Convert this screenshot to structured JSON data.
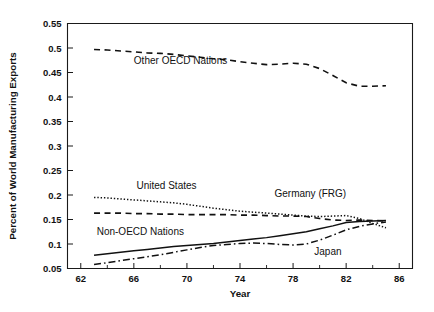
{
  "chart_data": {
    "type": "line",
    "title": "",
    "xlabel": "Year",
    "ylabel": "Percent of World Manufacturing Exports",
    "xlim": [
      61,
      87
    ],
    "ylim": [
      0.05,
      0.55
    ],
    "grid": false,
    "legend_position": "inline-annotations",
    "xticks": [
      62,
      66,
      70,
      74,
      78,
      82,
      86
    ],
    "xticks_minor": [
      64,
      68,
      72,
      76,
      80,
      84
    ],
    "yticks": [
      0.05,
      0.1,
      0.15,
      0.2,
      0.25,
      0.3,
      0.35,
      0.4,
      0.45,
      0.5,
      0.55
    ],
    "ytick_labels": [
      "0.05",
      "0.1",
      "0.15",
      "0.2",
      "0.25",
      "0.3",
      "0.35",
      "0.4",
      "0.45",
      "0.5",
      "0.55"
    ],
    "xtick_labels": [
      "62",
      "66",
      "70",
      "74",
      "78",
      "82",
      "86"
    ],
    "x": [
      63,
      64,
      65,
      66,
      67,
      68,
      69,
      70,
      71,
      72,
      73,
      74,
      75,
      76,
      77,
      78,
      79,
      80,
      81,
      82,
      83,
      84,
      85
    ],
    "series": [
      {
        "name": "Other OECD Nations",
        "linestyle": "dashed",
        "color": "#111111",
        "label_x": 66.0,
        "label_y": 0.468,
        "values": [
          0.497,
          0.496,
          0.494,
          0.492,
          0.49,
          0.489,
          0.487,
          0.484,
          0.481,
          0.478,
          0.476,
          0.472,
          0.469,
          0.466,
          0.467,
          0.469,
          0.467,
          0.458,
          0.444,
          0.429,
          0.422,
          0.422,
          0.423
        ]
      },
      {
        "name": "United States",
        "linestyle": "dotted",
        "color": "#111111",
        "label_x": 66.2,
        "label_y": 0.213,
        "values": [
          0.195,
          0.194,
          0.192,
          0.19,
          0.188,
          0.186,
          0.184,
          0.181,
          0.177,
          0.173,
          0.17,
          0.167,
          0.165,
          0.163,
          0.161,
          0.159,
          0.157,
          0.156,
          0.157,
          0.158,
          0.152,
          0.142,
          0.133
        ]
      },
      {
        "name": "Germany (FRG)",
        "linestyle": "dashed",
        "color": "#111111",
        "label_x": 76.6,
        "label_y": 0.196,
        "values": [
          0.163,
          0.163,
          0.163,
          0.162,
          0.162,
          0.161,
          0.161,
          0.16,
          0.16,
          0.16,
          0.16,
          0.159,
          0.159,
          0.158,
          0.157,
          0.157,
          0.156,
          0.152,
          0.149,
          0.148,
          0.149,
          0.148,
          0.147
        ]
      },
      {
        "name": "Non-OECD Nations",
        "linestyle": "solid",
        "color": "#111111",
        "label_x": 63.2,
        "label_y": 0.118,
        "values": [
          0.077,
          0.08,
          0.083,
          0.086,
          0.089,
          0.092,
          0.095,
          0.097,
          0.099,
          0.101,
          0.104,
          0.107,
          0.11,
          0.113,
          0.117,
          0.121,
          0.125,
          0.131,
          0.137,
          0.144,
          0.146,
          0.147,
          0.148
        ]
      },
      {
        "name": "Japan",
        "linestyle": "dashdot",
        "color": "#111111",
        "label_x": 79.6,
        "label_y": 0.078,
        "values": [
          0.058,
          0.062,
          0.066,
          0.07,
          0.074,
          0.078,
          0.083,
          0.088,
          0.093,
          0.097,
          0.099,
          0.101,
          0.102,
          0.101,
          0.099,
          0.098,
          0.1,
          0.108,
          0.118,
          0.129,
          0.136,
          0.141,
          0.145
        ]
      }
    ]
  }
}
